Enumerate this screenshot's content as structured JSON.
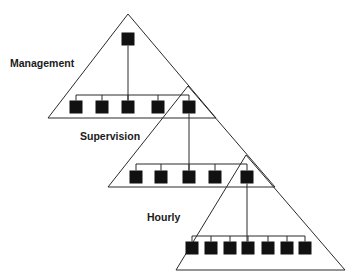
{
  "diagram": {
    "type": "hierarchy",
    "title": "",
    "tiers": [
      {
        "label": "Management",
        "label_pos": [
          10,
          67
        ],
        "apex": [
          128,
          14
        ],
        "base": [
          [
            48,
            118
          ],
          [
            216,
            118
          ]
        ],
        "head": {
          "x": 128,
          "y": 39
        },
        "connector_y": 95,
        "members_y": 107,
        "members_x": [
          76,
          102,
          128,
          158,
          189
        ],
        "link_to_next_index": 4
      },
      {
        "label": "Supervision",
        "label_pos": [
          80,
          140
        ],
        "apex": [
          188,
          86
        ],
        "base": [
          [
            108,
            187
          ],
          [
            275,
            187
          ]
        ],
        "head": {
          "x": 189,
          "y": 107
        },
        "connector_y": 164,
        "members_y": 177,
        "members_x": [
          136,
          161,
          189,
          215,
          247
        ],
        "link_to_next_index": 4
      },
      {
        "label": "Hourly",
        "label_pos": [
          147,
          221
        ],
        "apex": [
          246,
          155
        ],
        "base": [
          [
            176,
            270
          ],
          [
            345,
            270
          ]
        ],
        "head": {
          "x": 247,
          "y": 177
        },
        "connector_y": 236,
        "members_y": 248,
        "members_x": [
          192,
          211,
          230,
          248,
          268,
          287,
          305
        ],
        "link_to_next_index": null
      }
    ],
    "box_size": 13,
    "colors": {
      "box": "#111111",
      "line": "#2a2a2a",
      "text": "#1a1a1a",
      "background": "#ffffff"
    }
  }
}
